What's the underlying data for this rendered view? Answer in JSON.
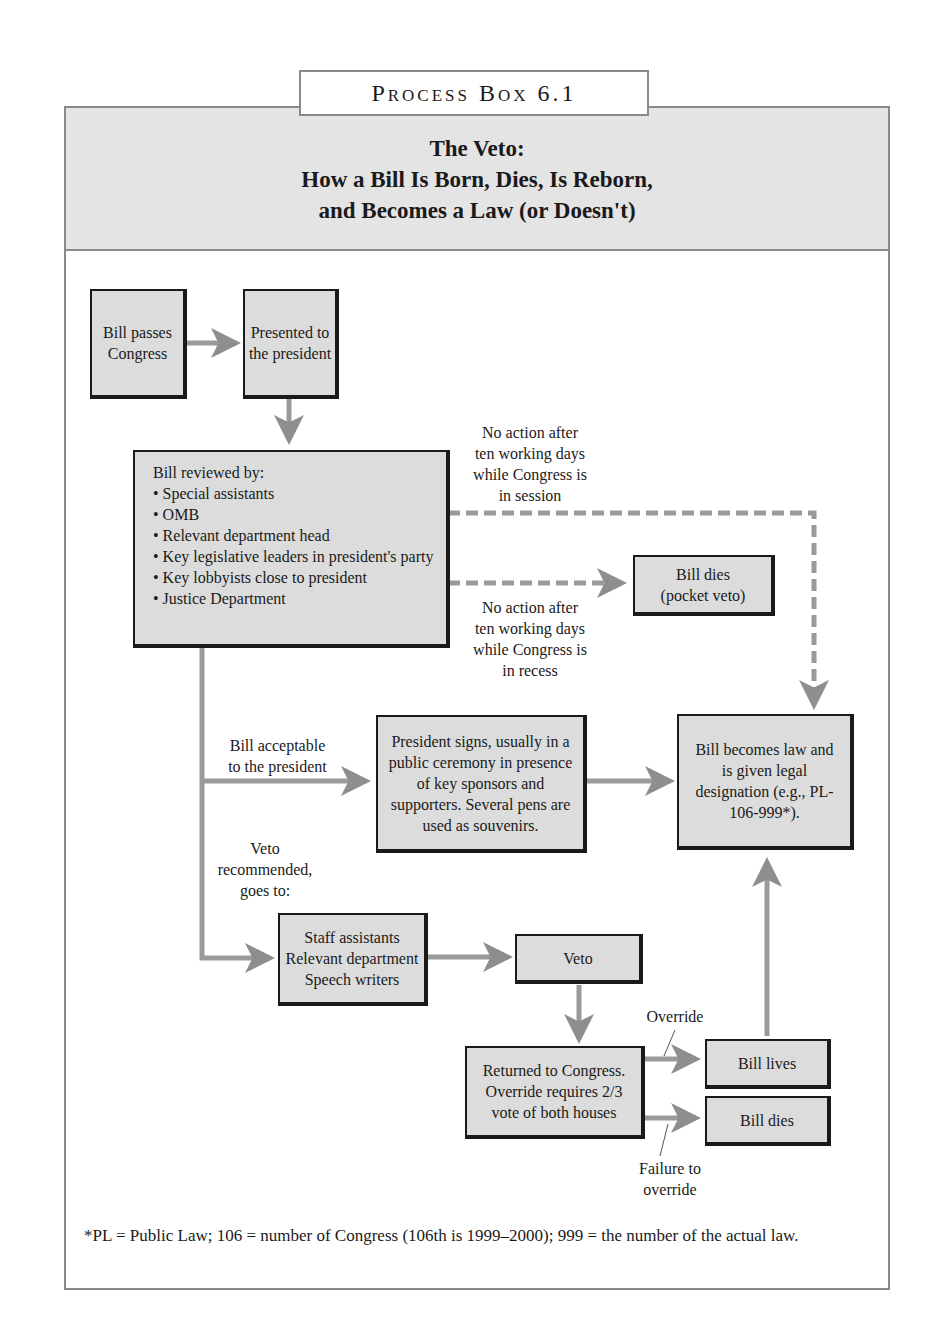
{
  "header": {
    "tag": "Process Box 6.1",
    "title_lines": [
      "The Veto:",
      "How a Bill Is Born, Dies, Is Reborn,",
      "and Becomes a Law (or Doesn't)"
    ]
  },
  "nodes": {
    "bill_passes": "Bill passes Congress",
    "presented": "Presented to the president",
    "reviewed": {
      "heading": "Bill reviewed by:",
      "items": [
        "Special assistants",
        "OMB",
        "Relevant department head",
        "Key legislative leaders in president's party",
        "Key lobbyists close to president",
        "Justice Department"
      ]
    },
    "pocket_veto": [
      "Bill dies",
      "(pocket veto)"
    ],
    "president_signs": "President signs, usually in a public ceremony in presence of key sponsors and supporters. Several pens are used as souvenirs.",
    "becomes_law": "Bill becomes law and is given legal designation (e.g., PL-106-999*).",
    "staff": [
      "Staff assistants",
      "Relevant department",
      "Speech writers"
    ],
    "veto": "Veto",
    "returned": "Returned to Congress. Override requires 2/3 vote of both houses",
    "bill_lives": "Bill lives",
    "bill_dies": "Bill dies"
  },
  "edge_labels": {
    "in_session": [
      "No action after",
      "ten working days",
      "while Congress is",
      "in session"
    ],
    "in_recess": [
      "No action after",
      "ten working days",
      "while Congress is",
      "in recess"
    ],
    "acceptable": [
      "Bill acceptable",
      "to the president"
    ],
    "veto_recommended": [
      "Veto",
      "recommended,",
      "goes to:"
    ],
    "override": "Override",
    "failure": [
      "Failure to",
      "override"
    ]
  },
  "footnote": "*PL = Public Law; 106 = number of Congress (106th is 1999–2000); 999 = the number of the actual law.",
  "colors": {
    "box_fill": "#dcdcdc",
    "arrow": "#8e8e8e",
    "header_fill": "#e4e4e4",
    "border": "#1a1a1a"
  }
}
